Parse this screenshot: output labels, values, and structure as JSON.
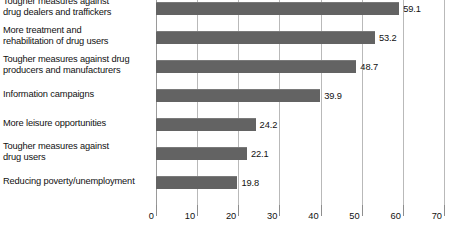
{
  "chart_data": {
    "type": "bar",
    "orientation": "horizontal",
    "title": "",
    "subtitle": "",
    "xlabel": "",
    "ylabel": "",
    "xlim": [
      0,
      70
    ],
    "xticks": [
      0,
      10,
      20,
      30,
      40,
      50,
      60,
      70
    ],
    "xtick_labels": [
      "0",
      "10",
      "20",
      "30",
      "40",
      "50",
      "60",
      "70"
    ],
    "grid": true,
    "legend": false,
    "legend_position": "none",
    "bar_color": "#636363",
    "gridline_color": "#b9b9b9",
    "text_color": "#111111",
    "categories": [
      "Tougher measures against drug dealers and traffickers",
      "More treatment and rehabilitation of drug users",
      "Tougher measures against drug producers and manufacturers",
      "Information campaigns",
      "More leisure opportunities",
      "Tougher measures against drug users",
      "Reducing poverty/unemployment"
    ],
    "category_lines": [
      [
        "Tougher measures against",
        "drug dealers and traffickers"
      ],
      [
        "More treatment and",
        "rehabilitation of drug users"
      ],
      [
        "Tougher measures against drug",
        "producers and manufacturers"
      ],
      [
        "Information campaigns"
      ],
      [
        "More leisure opportunities"
      ],
      [
        "Tougher measures against",
        "drug users"
      ],
      [
        "Reducing poverty/unemployment"
      ]
    ],
    "values": [
      59.1,
      53.2,
      48.7,
      39.9,
      24.2,
      22.1,
      19.8
    ],
    "value_labels": [
      "59.1",
      "53.2",
      "48.7",
      "39.9",
      "24.2",
      "22.1",
      "19.8"
    ],
    "bottom_cutoff_text": ""
  }
}
